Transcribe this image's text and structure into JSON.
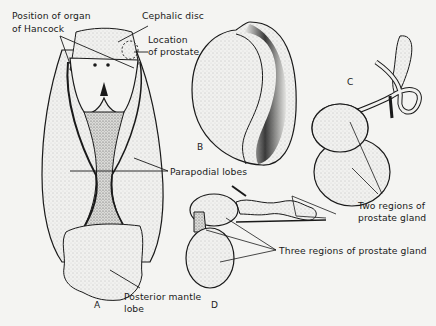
{
  "figure": {
    "panels": [
      {
        "id": "A",
        "label": "A"
      },
      {
        "id": "B",
        "label": "B"
      },
      {
        "id": "C",
        "label": "C"
      },
      {
        "id": "D",
        "label": "D"
      }
    ],
    "labels": {
      "organ_of_hancock_line1": "Position of organ",
      "organ_of_hancock_line2": "of Hancock",
      "cephalic_disc": "Cephalic disc",
      "location_line1": "Location",
      "location_line2": "of prostate",
      "parapodial_lobes": "Parapodial lobes",
      "posterior_mantle_line1": "Posterior mantle",
      "posterior_mantle_line2": "lobe",
      "two_regions_line1": "Two regions of",
      "two_regions_line2": "prostate gland",
      "three_regions": "Three regions of prostate gland"
    },
    "colors": {
      "background": "#f4f4f2",
      "ink": "#1a1a1a",
      "stipple": "#d9d9d6"
    }
  }
}
